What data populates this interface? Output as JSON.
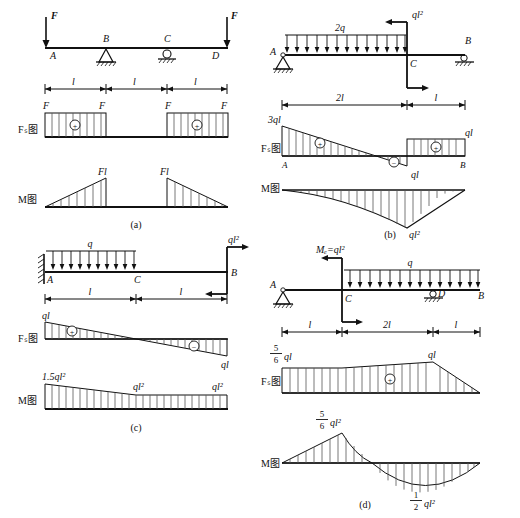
{
  "figure": {
    "title": "",
    "panels": [
      {
        "key": "a",
        "caption": "(a)",
        "beam": {
          "nodes": [
            "A",
            "B",
            "C",
            "D"
          ],
          "loads": [
            {
              "label": "F",
              "type": "point-down",
              "at": "A"
            },
            {
              "label": "F",
              "type": "point-down",
              "at": "D"
            }
          ],
          "supports": [
            {
              "type": "pin",
              "at": "B"
            },
            {
              "type": "roller",
              "at": "C"
            }
          ]
        },
        "dimensions": [
          "l",
          "l",
          "l"
        ],
        "shear": {
          "axis_label": "Fₛ图",
          "labels": [
            "F",
            "F",
            "F",
            "F"
          ],
          "sign_markers": [
            "+",
            "+"
          ],
          "end_labels": {
            "left": "",
            "right": ""
          }
        },
        "moment": {
          "axis_label": "M图",
          "labels": [
            "Fl",
            "Fl"
          ]
        }
      },
      {
        "key": "b",
        "caption": "(b)",
        "beam": {
          "nodes": [
            "A",
            "C",
            "B"
          ],
          "loads": [
            {
              "label": "2q",
              "type": "udl",
              "span": "A-C"
            },
            {
              "label": "ql²",
              "type": "couple",
              "at": "C"
            }
          ],
          "supports": [
            {
              "type": "pin",
              "at": "A"
            },
            {
              "type": "roller",
              "at": "B"
            }
          ]
        },
        "dimensions": [
          "2l",
          "l"
        ],
        "shear": {
          "axis_label": "Fₛ图",
          "labels": [
            "3ql",
            "ql",
            "ql"
          ],
          "sign_markers": [
            "+",
            "−",
            "+"
          ],
          "node_labels": [
            "A",
            "B"
          ]
        },
        "moment": {
          "axis_label": "M图",
          "labels": [
            "ql²"
          ]
        }
      },
      {
        "key": "c",
        "caption": "(c)",
        "beam": {
          "nodes": [
            "A",
            "C",
            "B"
          ],
          "loads": [
            {
              "label": "q",
              "type": "udl",
              "span": "A-C"
            },
            {
              "label": "ql²",
              "type": "couple",
              "at": "B"
            }
          ],
          "supports": [
            {
              "type": "fixed",
              "at": "A"
            }
          ]
        },
        "dimensions": [
          "l",
          "l"
        ],
        "shear": {
          "axis_label": "Fₛ图",
          "labels": [
            "ql",
            "ql"
          ],
          "sign_markers": [
            "+",
            "−"
          ]
        },
        "moment": {
          "axis_label": "M图",
          "labels": [
            "1.5ql²",
            "ql²",
            "ql²"
          ]
        }
      },
      {
        "key": "d",
        "caption": "(d)",
        "beam": {
          "nodes": [
            "A",
            "C",
            "D",
            "B"
          ],
          "loads": [
            {
              "label": "q",
              "type": "udl",
              "span": "C-B"
            },
            {
              "label": "Mₑ=ql²",
              "type": "couple",
              "at": "C"
            }
          ],
          "supports": [
            {
              "type": "pin",
              "at": "A"
            },
            {
              "type": "roller",
              "at": "D"
            }
          ]
        },
        "dimensions": [
          "l",
          "2l",
          "l"
        ],
        "shear": {
          "axis_label": "Fₛ图",
          "labels": [
            "5/6 ql",
            "ql"
          ],
          "frac_num": "5",
          "frac_den": "6",
          "frac_unit": "ql",
          "sign_markers": [
            "+"
          ]
        },
        "moment": {
          "axis_label": "M图",
          "peak": {
            "num": "5",
            "den": "6",
            "unit": "ql²"
          },
          "trough": {
            "num": "1",
            "den": "2",
            "unit": "ql²"
          }
        }
      }
    ]
  },
  "colors": {
    "line": "#111111",
    "hatch": "#555555",
    "beam": "#000000"
  }
}
